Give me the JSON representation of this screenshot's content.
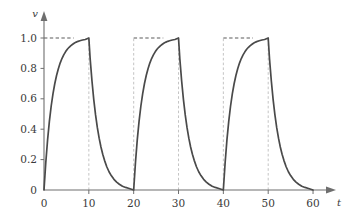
{
  "chart_data": {
    "type": "line",
    "title": "",
    "subtitle": "",
    "xlabel": "t",
    "ylabel": "v",
    "xlim": [
      0,
      62
    ],
    "ylim": [
      0,
      1.08
    ],
    "xticks": [
      0,
      10,
      20,
      30,
      40,
      50,
      60
    ],
    "xticklabels": [
      "0",
      "10",
      "20",
      "30",
      "40",
      "50",
      "60"
    ],
    "yticks": [
      0,
      0.2,
      0.4,
      0.6,
      0.8,
      1.0
    ],
    "yticklabels": [
      "0",
      "0.2",
      "0.4",
      "0.6",
      "0.8",
      "1.0"
    ],
    "grid": false,
    "legend": "none",
    "curve_color": "#4a4a4a",
    "grid_color": "#bdbdbd",
    "axis_color": "#6e6e6e",
    "reference_lines": {
      "horizontal": [
        {
          "y": 1.0,
          "x_from": 0,
          "x_to": 6.6,
          "style": "dashed"
        },
        {
          "y": 1.0,
          "x_from": 20,
          "x_to": 26.6,
          "style": "dashed"
        },
        {
          "y": 1.0,
          "x_from": 40,
          "x_to": 46.6,
          "style": "dashed"
        }
      ],
      "vertical": [
        {
          "x": 10,
          "y_from": 0,
          "y_to": 1.0,
          "style": "dashed"
        },
        {
          "x": 20,
          "y_from": 0,
          "y_to": 1.0,
          "style": "dashed"
        },
        {
          "x": 30,
          "y_from": 0,
          "y_to": 1.0,
          "style": "dashed"
        },
        {
          "x": 40,
          "y_from": 0,
          "y_to": 1.0,
          "style": "dashed"
        },
        {
          "x": 50,
          "y_from": 0,
          "y_to": 1.0,
          "style": "dashed"
        }
      ]
    },
    "series": [
      {
        "name": "v(t)",
        "color": "#4a4a4a",
        "x": [
          0,
          0.4,
          0.8,
          1.2,
          1.6,
          2.0,
          2.4,
          2.8,
          3.2,
          3.6,
          4.0,
          4.4,
          4.8,
          5.2,
          5.6,
          6.0,
          6.4,
          6.8,
          7.2,
          7.6,
          8.0,
          8.6,
          9.2,
          10.0,
          10.3,
          10.7,
          11.1,
          11.5,
          11.9,
          12.3,
          12.7,
          13.1,
          13.5,
          14.0,
          14.5,
          15.0,
          15.6,
          16.2,
          16.8,
          17.5,
          18.2,
          19.0,
          20.0,
          20.4,
          20.8,
          21.2,
          21.6,
          22.0,
          22.4,
          22.8,
          23.2,
          23.6,
          24.0,
          24.4,
          24.8,
          25.2,
          25.6,
          26.0,
          26.4,
          26.8,
          27.2,
          27.6,
          28.0,
          28.6,
          29.2,
          30.0,
          30.3,
          30.7,
          31.1,
          31.5,
          31.9,
          32.3,
          32.7,
          33.1,
          33.5,
          34.0,
          34.5,
          35.0,
          35.6,
          36.2,
          36.8,
          37.5,
          38.2,
          39.0,
          40.0,
          40.4,
          40.8,
          41.2,
          41.6,
          42.0,
          42.4,
          42.8,
          43.2,
          43.6,
          44.0,
          44.4,
          44.8,
          45.2,
          45.6,
          46.0,
          46.4,
          46.8,
          47.2,
          47.6,
          48.0,
          48.6,
          49.2,
          50.0,
          50.3,
          50.7,
          51.1,
          51.5,
          51.9,
          52.3,
          52.7,
          53.1,
          53.5,
          54.0,
          54.5,
          55.0,
          55.6,
          56.2,
          56.8,
          57.5,
          58.2,
          59.0,
          60.0
        ],
        "y": [
          0.0,
          0.181,
          0.33,
          0.451,
          0.551,
          0.632,
          0.699,
          0.753,
          0.798,
          0.835,
          0.865,
          0.889,
          0.909,
          0.926,
          0.939,
          0.95,
          0.959,
          0.967,
          0.973,
          0.978,
          0.982,
          0.987,
          0.99,
          1.0,
          0.861,
          0.717,
          0.595,
          0.494,
          0.41,
          0.341,
          0.283,
          0.235,
          0.195,
          0.153,
          0.12,
          0.095,
          0.07,
          0.052,
          0.038,
          0.025,
          0.017,
          0.01,
          0.0,
          0.181,
          0.33,
          0.451,
          0.551,
          0.632,
          0.699,
          0.753,
          0.798,
          0.835,
          0.865,
          0.889,
          0.909,
          0.926,
          0.939,
          0.95,
          0.959,
          0.967,
          0.973,
          0.978,
          0.982,
          0.987,
          0.99,
          1.0,
          0.861,
          0.717,
          0.595,
          0.494,
          0.41,
          0.341,
          0.283,
          0.235,
          0.195,
          0.153,
          0.12,
          0.095,
          0.07,
          0.052,
          0.038,
          0.025,
          0.017,
          0.01,
          0.0,
          0.181,
          0.33,
          0.451,
          0.551,
          0.632,
          0.699,
          0.753,
          0.798,
          0.835,
          0.865,
          0.889,
          0.909,
          0.926,
          0.939,
          0.95,
          0.959,
          0.967,
          0.973,
          0.978,
          0.982,
          0.987,
          0.99,
          1.0,
          0.861,
          0.717,
          0.595,
          0.494,
          0.41,
          0.341,
          0.283,
          0.235,
          0.195,
          0.153,
          0.12,
          0.095,
          0.07,
          0.052,
          0.038,
          0.025,
          0.017,
          0.01,
          0.0
        ]
      }
    ]
  }
}
